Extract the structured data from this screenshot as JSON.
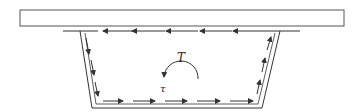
{
  "diagram": {
    "labels": {
      "torque": "T",
      "shear": "τ"
    },
    "colors": {
      "stroke": "#333333",
      "slab_stroke": "#555555",
      "background": "#ffffff"
    },
    "elements": {
      "slab": "deck-slab-rectangle",
      "web": "trapezoidal-box-web",
      "arrows_top": 6,
      "arrows_left": 3,
      "arrows_bottom": 5,
      "arrows_right": 3,
      "torque_arc": "counterclockwise-arc"
    }
  }
}
